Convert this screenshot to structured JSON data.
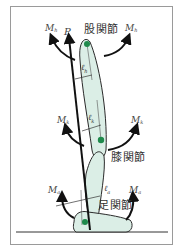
{
  "diagram": {
    "force_label": "P",
    "joints": [
      {
        "id": "hip",
        "label": "股関節",
        "moment": "M",
        "moment_sub": "h",
        "lever": "ℓ",
        "lever_sub": "h"
      },
      {
        "id": "knee",
        "label": "膝関節",
        "moment": "M",
        "moment_sub": "k",
        "lever": "ℓ",
        "lever_sub": "k"
      },
      {
        "id": "ankle",
        "label": "足関節",
        "moment": "M",
        "moment_sub": "a",
        "lever": "ℓ",
        "lever_sub": "a"
      }
    ],
    "colors": {
      "segment_fill": "#dbeee6",
      "segment_stroke": "#2a2a2a",
      "joint_dot": "#1f8a4c",
      "arrow": "#111111",
      "frame": "#9a9a9a"
    }
  }
}
